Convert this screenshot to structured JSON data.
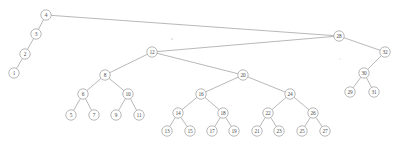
{
  "diagram": {
    "type": "binary-search-tree",
    "title": "",
    "background_color": "#ffffff",
    "node_stroke_color": "#9a9a9a",
    "node_fill_color": "#ffffff",
    "edge_color": "#9a9a9a",
    "label_color": "#4d4d4d",
    "node_radius": 5.2,
    "root": "4",
    "nodes": [
      {
        "id": "1",
        "label": "1",
        "x": 14,
        "y": 73
      },
      {
        "id": "2",
        "label": "2",
        "x": 25,
        "y": 54
      },
      {
        "id": "3",
        "label": "3",
        "x": 36,
        "y": 34
      },
      {
        "id": "4",
        "label": "4",
        "x": 46,
        "y": 15
      },
      {
        "id": "5",
        "label": "5",
        "x": 71,
        "y": 115
      },
      {
        "id": "6",
        "label": "6",
        "x": 83,
        "y": 94
      },
      {
        "id": "7",
        "label": "7",
        "x": 94,
        "y": 115
      },
      {
        "id": "8",
        "label": "8",
        "x": 105,
        "y": 75
      },
      {
        "id": "9",
        "label": "9",
        "x": 116,
        "y": 115
      },
      {
        "id": "10",
        "label": "10",
        "x": 128,
        "y": 94
      },
      {
        "id": "11",
        "label": "11",
        "x": 139,
        "y": 115
      },
      {
        "id": "12",
        "label": "12",
        "x": 152,
        "y": 52
      },
      {
        "id": "13",
        "label": "13",
        "x": 167,
        "y": 131
      },
      {
        "id": "14",
        "label": "14",
        "x": 178,
        "y": 113
      },
      {
        "id": "15",
        "label": "15",
        "x": 190,
        "y": 131
      },
      {
        "id": "16",
        "label": "16",
        "x": 201,
        "y": 94
      },
      {
        "id": "17",
        "label": "17",
        "x": 212,
        "y": 131
      },
      {
        "id": "18",
        "label": "18",
        "x": 223,
        "y": 113
      },
      {
        "id": "19",
        "label": "19",
        "x": 234,
        "y": 131
      },
      {
        "id": "20",
        "label": "20",
        "x": 243,
        "y": 75
      },
      {
        "id": "21",
        "label": "21",
        "x": 257,
        "y": 131
      },
      {
        "id": "22",
        "label": "22",
        "x": 268,
        "y": 113
      },
      {
        "id": "23",
        "label": "23",
        "x": 279,
        "y": 131
      },
      {
        "id": "24",
        "label": "24",
        "x": 290,
        "y": 94
      },
      {
        "id": "25",
        "label": "25",
        "x": 302,
        "y": 131
      },
      {
        "id": "26",
        "label": "26",
        "x": 313,
        "y": 113
      },
      {
        "id": "27",
        "label": "27",
        "x": 325,
        "y": 131
      },
      {
        "id": "28",
        "label": "28",
        "x": 339,
        "y": 36
      },
      {
        "id": "29",
        "label": "29",
        "x": 350,
        "y": 92
      },
      {
        "id": "30",
        "label": "30",
        "x": 364,
        "y": 73
      },
      {
        "id": "31",
        "label": "31",
        "x": 374,
        "y": 92
      },
      {
        "id": "32",
        "label": "32",
        "x": 385,
        "y": 52
      }
    ],
    "edges": [
      {
        "from": "4",
        "to": "3"
      },
      {
        "from": "3",
        "to": "2"
      },
      {
        "from": "2",
        "to": "1"
      },
      {
        "from": "4",
        "to": "28"
      },
      {
        "from": "28",
        "to": "12"
      },
      {
        "from": "28",
        "to": "32"
      },
      {
        "from": "32",
        "to": "30"
      },
      {
        "from": "30",
        "to": "29"
      },
      {
        "from": "30",
        "to": "31"
      },
      {
        "from": "12",
        "to": "8"
      },
      {
        "from": "12",
        "to": "20"
      },
      {
        "from": "8",
        "to": "6"
      },
      {
        "from": "8",
        "to": "10"
      },
      {
        "from": "6",
        "to": "5"
      },
      {
        "from": "6",
        "to": "7"
      },
      {
        "from": "10",
        "to": "9"
      },
      {
        "from": "10",
        "to": "11"
      },
      {
        "from": "20",
        "to": "16"
      },
      {
        "from": "20",
        "to": "24"
      },
      {
        "from": "16",
        "to": "14"
      },
      {
        "from": "16",
        "to": "18"
      },
      {
        "from": "14",
        "to": "13"
      },
      {
        "from": "14",
        "to": "15"
      },
      {
        "from": "18",
        "to": "17"
      },
      {
        "from": "18",
        "to": "19"
      },
      {
        "from": "24",
        "to": "22"
      },
      {
        "from": "24",
        "to": "26"
      },
      {
        "from": "22",
        "to": "21"
      },
      {
        "from": "22",
        "to": "23"
      },
      {
        "from": "26",
        "to": "25"
      },
      {
        "from": "26",
        "to": "27"
      }
    ],
    "specks": [
      {
        "x": 172,
        "y": 39,
        "r": 0.9
      },
      {
        "x": 340,
        "y": 59,
        "r": 0.7
      }
    ]
  }
}
